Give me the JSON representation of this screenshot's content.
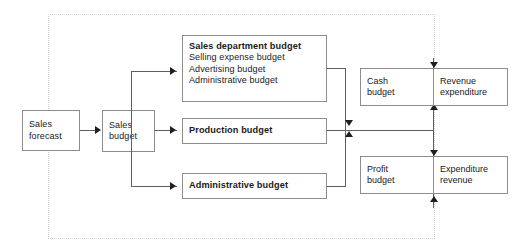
{
  "diagram": {
    "type": "flow-diagram",
    "background": "#ffffff",
    "line_color": "#5f5f5f",
    "box_border_color": "#8d8d8d",
    "dotted_border_color": "#d0d0d0",
    "nodes": {
      "sales_forecast": {
        "label": "Sales\nforecast"
      },
      "sales_budget": {
        "label": "Sales\nbudget"
      },
      "sales_department_budget": {
        "title": "Sales department budget",
        "lines": [
          "Selling expense budget",
          "Advertising budget",
          "Administrative budget"
        ]
      },
      "production_budget": {
        "title": "Production budget"
      },
      "administrative_budget": {
        "title": "Administrative budget"
      },
      "cash_budget": {
        "label": "Cash\nbudget"
      },
      "revenue_expenditure": {
        "label": "Revenue\nexpenditure"
      },
      "profit_budget": {
        "label": "Profit\nbudget"
      },
      "expenditure_revenue": {
        "label": "Expenditure\nrevenue"
      }
    }
  }
}
